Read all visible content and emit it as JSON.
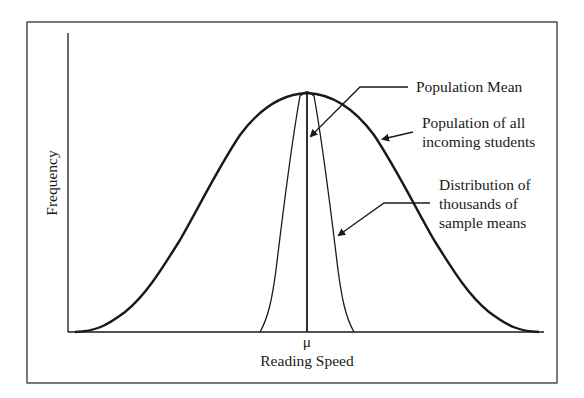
{
  "diagram": {
    "title": "",
    "y_axis_label": "Frequency",
    "x_axis_label": "Reading Speed",
    "mean_symbol": "μ",
    "annotations": {
      "population_mean": "Population Mean",
      "population_line1": "Population of all",
      "population_line2": "incoming students",
      "sampling_line1": "Distribution of",
      "sampling_line2": "thousands of",
      "sampling_line3": "sample means"
    },
    "curves": [
      {
        "name": "Population of all incoming students",
        "shape": "wide normal curve"
      },
      {
        "name": "Distribution of thousands of sample means",
        "shape": "narrow normal curve"
      }
    ],
    "colors": {
      "line": "#1a1a1a",
      "background": "#ffffff"
    }
  }
}
